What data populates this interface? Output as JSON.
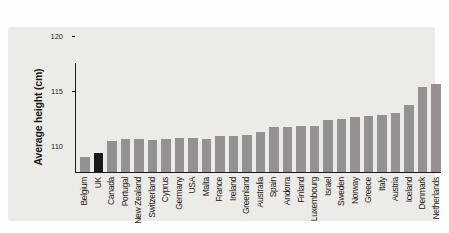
{
  "figure": {
    "page_background": "#fdfdfc",
    "card_background": "#edebe8",
    "axis_color": "#1d1b19",
    "text_color": "#1d1b19"
  },
  "chart_data": {
    "type": "bar",
    "title": "",
    "xlabel": "",
    "ylabel": "Average height (cm)",
    "ylim": [
      110,
      120
    ],
    "yticks": [
      110,
      115,
      120
    ],
    "grid": false,
    "legend": null,
    "bar_color": "#949190",
    "highlight": {
      "category": "UK",
      "color": "#1c1a18"
    },
    "categories": [
      "Belgium",
      "UK",
      "Canada",
      "Portugal",
      "New Zealand",
      "Switzerland",
      "Cyprus",
      "Germany",
      "USA",
      "Malta",
      "France",
      "Ireland",
      "Greenland",
      "Australia",
      "Spain",
      "Andorra",
      "Finland",
      "Luxembourg",
      "Israel",
      "Sweden",
      "Norway",
      "Greece",
      "Italy",
      "Austria",
      "Iceland",
      "Denmark",
      "Netherlands"
    ],
    "values": [
      111.4,
      111.7,
      112.8,
      113.0,
      113.0,
      112.9,
      113.0,
      113.1,
      113.1,
      113.0,
      113.3,
      113.3,
      113.4,
      113.6,
      114.1,
      114.1,
      114.2,
      114.2,
      114.7,
      114.8,
      115.0,
      115.1,
      115.2,
      115.4,
      116.1,
      117.7,
      118.0
    ]
  }
}
